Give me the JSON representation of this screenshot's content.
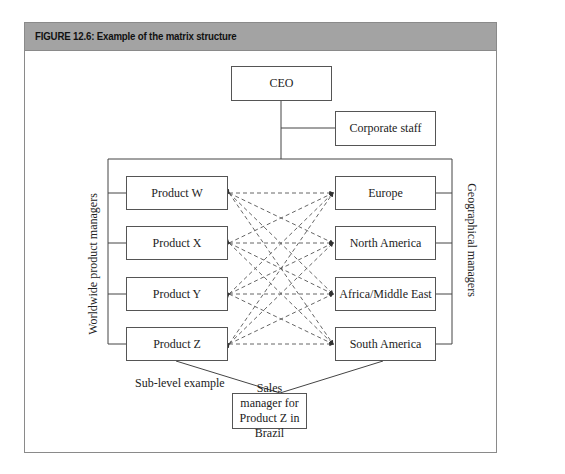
{
  "figure": {
    "title": "FIGURE 12.6: Example of the matrix structure",
    "header_color": "#a3a3a3"
  },
  "diagram": {
    "ceo": "CEO",
    "corporate_staff": "Corporate staff",
    "left_axis_label": "Worldwide product managers",
    "right_axis_label": "Geographical managers",
    "products": [
      "Product W",
      "Product X",
      "Product Y",
      "Product Z"
    ],
    "regions": [
      "Europe",
      "North America",
      "Africa/Middle East",
      "South America"
    ],
    "sub_level_label": "Sub-level example",
    "sub_level_box": "Sales manager for Product Z in Brazil",
    "connections": "every product connected to every region (dashed, bidirectional)"
  }
}
